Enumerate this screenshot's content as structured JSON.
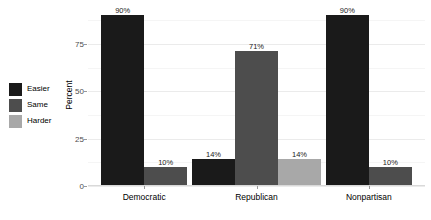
{
  "chart_data": {
    "type": "bar",
    "title": "",
    "subtitle": "",
    "xlabel": "",
    "ylabel": "Percent",
    "categories": [
      "Democratic",
      "Republican",
      "Nonpartisan"
    ],
    "series": [
      {
        "name": "Easier",
        "color": "#1a1a1a",
        "values": [
          90,
          14,
          90
        ]
      },
      {
        "name": "Same",
        "color": "#4d4d4d",
        "values": [
          10,
          71,
          10
        ]
      },
      {
        "name": "Harder",
        "color": "#a8a8a8",
        "values": [
          null,
          14,
          null
        ]
      }
    ],
    "data_labels": {
      "Democratic": {
        "Easier": "90%",
        "Same": "10%",
        "Harder": ""
      },
      "Republican": {
        "Easier": "14%",
        "Same": "71%",
        "Harder": "14%"
      },
      "Nonpartisan": {
        "Easier": "90%",
        "Same": "10%",
        "Harder": ""
      }
    },
    "ylim": [
      0,
      95
    ],
    "yticks": [
      0,
      25,
      50,
      75
    ],
    "ytick_labels": [
      "0",
      "25",
      "50",
      "75"
    ],
    "grid": true,
    "legend_position": "left",
    "legend_title": ""
  },
  "axis": {
    "y_title": "Percent",
    "y_ticks": [
      {
        "value": 75,
        "label": "75"
      },
      {
        "value": 50,
        "label": "50"
      },
      {
        "value": 25,
        "label": "25"
      },
      {
        "value": 0,
        "label": "0"
      }
    ],
    "x_ticks": [
      {
        "label": "Democratic"
      },
      {
        "label": "Republican"
      },
      {
        "label": "Nonpartisan"
      }
    ]
  },
  "legend": {
    "items": [
      {
        "label": "Easier",
        "color": "#1a1a1a"
      },
      {
        "label": "Same",
        "color": "#4d4d4d"
      },
      {
        "label": "Harder",
        "color": "#a8a8a8"
      }
    ]
  },
  "bars": [
    {
      "group": "Democratic",
      "series": "Easier",
      "value": 90,
      "label": "90%",
      "color": "#1a1a1a"
    },
    {
      "group": "Democratic",
      "series": "Same",
      "value": 10,
      "label": "10%",
      "color": "#4d4d4d"
    },
    {
      "group": "Republican",
      "series": "Easier",
      "value": 14,
      "label": "14%",
      "color": "#1a1a1a"
    },
    {
      "group": "Republican",
      "series": "Same",
      "value": 71,
      "label": "71%",
      "color": "#4d4d4d"
    },
    {
      "group": "Republican",
      "series": "Harder",
      "value": 14,
      "label": "14%",
      "color": "#a8a8a8"
    },
    {
      "group": "Nonpartisan",
      "series": "Easier",
      "value": 90,
      "label": "90%",
      "color": "#1a1a1a"
    },
    {
      "group": "Nonpartisan",
      "series": "Same",
      "value": 10,
      "label": "10%",
      "color": "#4d4d4d"
    }
  ],
  "theme": {
    "panel_background": "#ffffff",
    "gridline_major": "#ebebeb",
    "gridline_minor": "#f5f5f5",
    "axis_text": "#4d4d4d",
    "label_text": "#1a1a1a"
  }
}
